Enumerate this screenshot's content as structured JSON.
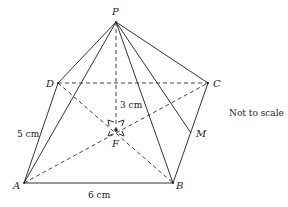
{
  "diagram": {
    "type": "square-based pyramid",
    "vertices": {
      "P": {
        "label": "P",
        "x": 116,
        "y": 22
      },
      "A": {
        "label": "A",
        "x": 24,
        "y": 183
      },
      "B": {
        "label": "B",
        "x": 173,
        "y": 183
      },
      "C": {
        "label": "C",
        "x": 208,
        "y": 83
      },
      "D": {
        "label": "D",
        "x": 58,
        "y": 83
      },
      "F": {
        "label": "F",
        "x": 116,
        "y": 130
      },
      "M": {
        "label": "M",
        "x": 191,
        "y": 133
      }
    },
    "measurements": {
      "height": "3 cm",
      "ad": "5 cm",
      "ab": "6 cm"
    },
    "note": "Not to scale"
  }
}
